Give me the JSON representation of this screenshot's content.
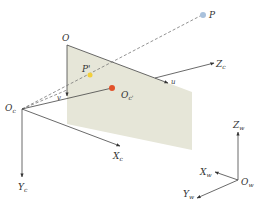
{
  "diagram": {
    "colors": {
      "image_plane": "#e6e6d8",
      "line": "#444444",
      "dashed_ray": "#666666",
      "point_P": "#a9c1dc",
      "point_P_prime": "#f2cf3a",
      "principal_point": "#e2522a"
    },
    "labels": {
      "P": "P",
      "P_prime": "P'",
      "O": "O",
      "u": "u",
      "v": "v",
      "Oc_prime_main": "O",
      "Oc_prime_sub": "c'",
      "Oc_main": "O",
      "Oc_sub": "c",
      "Xc_main": "X",
      "Xc_sub": "c",
      "Yc_main": "Y",
      "Yc_sub": "c",
      "Zc_main": "Z",
      "Zc_sub": "c",
      "Zw_main": "Z",
      "Zw_sub": "w",
      "Xw_main": "X",
      "Xw_sub": "w",
      "Yw_main": "Y",
      "Yw_sub": "w",
      "Ow_main": "O",
      "Ow_sub": "w"
    },
    "nodes": [
      {
        "id": "P",
        "desc": "world point"
      },
      {
        "id": "P'",
        "desc": "projected image point"
      },
      {
        "id": "O",
        "desc": "image plane origin (pixel coords)"
      },
      {
        "id": "Oc'",
        "desc": "principal point"
      },
      {
        "id": "Oc",
        "desc": "camera optical center"
      },
      {
        "id": "Ow",
        "desc": "world origin"
      }
    ],
    "edges": [
      {
        "from": "Oc",
        "to": "P",
        "style": "dashed",
        "via": "P'"
      },
      {
        "from": "Oc",
        "to": "O",
        "style": "dashed"
      },
      {
        "from": "Oc",
        "to": "Zc",
        "style": "solid-arrow",
        "via": "Oc'"
      },
      {
        "from": "Oc",
        "to": "Xc",
        "style": "solid-arrow"
      },
      {
        "from": "Oc",
        "to": "Yc",
        "style": "solid-arrow"
      },
      {
        "from": "O",
        "to": "u",
        "style": "solid-arrow"
      },
      {
        "from": "O",
        "to": "v",
        "style": "solid-arrow"
      },
      {
        "from": "Ow",
        "to": "Zw",
        "style": "solid-arrow"
      },
      {
        "from": "Ow",
        "to": "Xw",
        "style": "solid-arrow"
      },
      {
        "from": "Ow",
        "to": "Yw",
        "style": "solid-arrow"
      }
    ]
  }
}
